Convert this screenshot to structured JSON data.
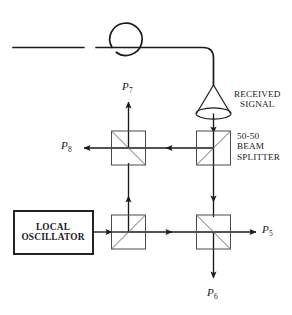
{
  "diagram": {
    "stroke_color": "#1a1a1a",
    "splitter_color": "#4a4a4a",
    "background": "#ffffff"
  },
  "source": {
    "name": "optical-fiber-input",
    "loop_label": "",
    "antenna": {
      "name": "horn-lens-antenna",
      "caption_line1": "RECEIVED",
      "caption_line2": "SIGNAL"
    }
  },
  "local_oscillator": {
    "line1": "LOCAL",
    "line2": "OSCILLATOR"
  },
  "beam_splitters": {
    "caption_line1": "50-50",
    "caption_line2": "BEAM",
    "caption_line3": "SPLITTER",
    "items": [
      {
        "id": "bs-top-left",
        "diagonal": "tl-br"
      },
      {
        "id": "bs-top-right",
        "diagonal": "bl-tr"
      },
      {
        "id": "bs-bottom-left",
        "diagonal": "tl-br"
      },
      {
        "id": "bs-bottom-right",
        "diagonal": "tl-br"
      }
    ]
  },
  "ports": [
    {
      "id": "p7",
      "symbol": "P",
      "subscript": "7",
      "direction": "up",
      "position": "top-left-output"
    },
    {
      "id": "p8",
      "symbol": "P",
      "subscript": "8",
      "direction": "left",
      "position": "left-output"
    },
    {
      "id": "p5",
      "symbol": "P",
      "subscript": "5",
      "direction": "right",
      "position": "right-output"
    },
    {
      "id": "p6",
      "symbol": "P",
      "subscript": "6",
      "direction": "down",
      "position": "bottom-output"
    }
  ]
}
